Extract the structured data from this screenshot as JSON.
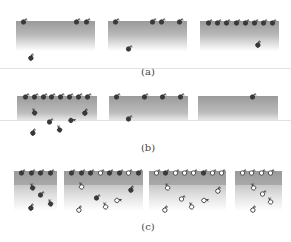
{
  "figure": {
    "labels": {
      "a": "(a)",
      "b": "(b)",
      "c": "(c)"
    },
    "colors": {
      "filled_molecule": "#3a3a3a",
      "open_molecule": "#ffffff",
      "stroke": "#333333",
      "surface_top": "#9a9a9a"
    }
  },
  "rows": [
    {
      "id": "a",
      "panels": [
        {
          "surface_molecules": 3,
          "bulk_molecules": 1
        },
        {
          "surface_molecules": 4,
          "bulk_molecules": 1
        },
        {
          "surface_molecules": 8,
          "bulk_molecules": 1
        }
      ]
    },
    {
      "id": "b",
      "panels": [
        {
          "surface_molecules": 8,
          "bulk_molecules": 6
        },
        {
          "surface_molecules": 4,
          "bulk_molecules": 1
        },
        {
          "surface_molecules": 1,
          "bulk_molecules": 0
        }
      ]
    },
    {
      "id": "c",
      "panels": [
        {
          "surface_molecules": 4,
          "surface_types": [
            "filled",
            "filled",
            "filled",
            "filled"
          ],
          "bulk_molecules": 4,
          "bulk_types": [
            "filled",
            "filled",
            "filled",
            "filled"
          ]
        },
        {
          "surface_molecules": 8,
          "surface_types": [
            "filled",
            "filled",
            "filled",
            "open",
            "filled",
            "filled",
            "open",
            "filled"
          ],
          "bulk_molecules": 6,
          "bulk_types": [
            "open",
            "filled",
            "open",
            "open",
            "open",
            "filled"
          ]
        },
        {
          "surface_molecules": 8,
          "surface_types": [
            "open",
            "filled",
            "open",
            "open",
            "open",
            "filled",
            "open",
            "open"
          ],
          "bulk_molecules": 6,
          "bulk_types": [
            "open",
            "open",
            "open",
            "open",
            "open",
            "open"
          ]
        },
        {
          "surface_molecules": 4,
          "surface_types": [
            "open",
            "open",
            "open",
            "open"
          ],
          "bulk_molecules": 4,
          "bulk_types": [
            "open",
            "open",
            "open",
            "open"
          ]
        }
      ]
    }
  ]
}
